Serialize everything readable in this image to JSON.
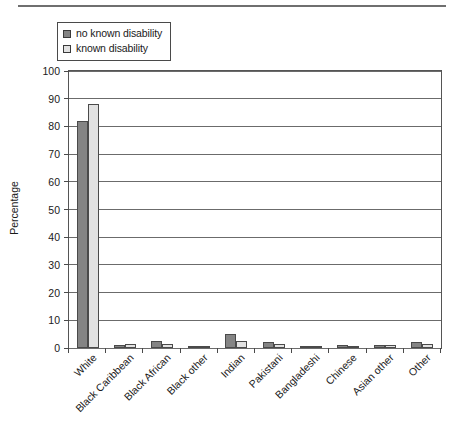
{
  "figure": {
    "yaxis_title": "Percentage"
  },
  "legend": {
    "items": [
      {
        "label": "no known disability",
        "color": "#848484",
        "swatch": "legend-swatch-no-known-disability"
      },
      {
        "label": "known disability",
        "color": "#e2e2e2",
        "swatch": "legend-swatch-known-disability"
      }
    ]
  },
  "chart_data": {
    "type": "bar",
    "title": "",
    "xlabel": "",
    "ylabel": "Percentage",
    "ylim": [
      0,
      100
    ],
    "ytick_step": 10,
    "yticks": [
      0,
      10,
      20,
      30,
      40,
      50,
      60,
      70,
      80,
      90,
      100
    ],
    "ytick_labels": [
      "0",
      "10",
      "20",
      "30",
      "40",
      "50",
      "60",
      "70",
      "80",
      "90",
      "100"
    ],
    "grid": true,
    "grid_axis": "y",
    "legend_position": "top-left",
    "categories": [
      "White",
      "Black Caribbean",
      "Black African",
      "Black other",
      "Indian",
      "Pakistani",
      "Bangladeshi",
      "Chinese",
      "Asian other",
      "Other"
    ],
    "series": [
      {
        "name": "no known disability",
        "color": "#848484",
        "values": [
          82,
          1.2,
          2.5,
          0.7,
          5,
          2,
          0.5,
          1,
          1,
          2
        ]
      },
      {
        "name": "known disability",
        "color": "#e2e2e2",
        "values": [
          88,
          1.5,
          1.5,
          0.5,
          2.5,
          1.5,
          0.4,
          0.5,
          1,
          1.5
        ]
      }
    ]
  }
}
